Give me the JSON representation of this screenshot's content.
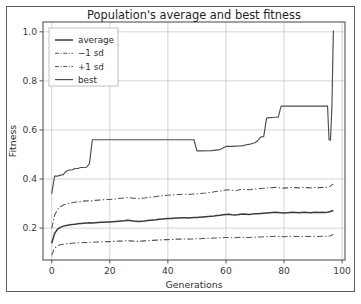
{
  "figure": {
    "background_color": "#ffffff",
    "border_color": "#5d5d5d",
    "width": 361,
    "height": 304
  },
  "chart_data": {
    "type": "line",
    "title": "Population's average and best fitness",
    "xlabel": "Generations",
    "ylabel": "Fitness",
    "xlim": [
      -3,
      101
    ],
    "ylim": [
      0.07,
      1.04
    ],
    "xticks": [
      0,
      20,
      40,
      60,
      80,
      100
    ],
    "xtick_labels": [
      "0",
      "20",
      "40",
      "60",
      "80",
      "100"
    ],
    "yticks": [
      0.2,
      0.4,
      0.6,
      0.8,
      1.0
    ],
    "ytick_labels": [
      "0.2",
      "0.4",
      "0.6",
      "0.8",
      "1.0"
    ],
    "grid": true,
    "grid_color": "#c9c9c9",
    "legend_position": "upper left",
    "line_color": "#4d4d4d",
    "series": [
      {
        "name": "average",
        "style": "solid",
        "color": "#3c3c3c",
        "x": [
          0,
          1,
          2,
          3,
          4,
          5,
          6,
          7,
          8,
          9,
          10,
          11,
          12,
          13,
          14,
          15,
          16,
          17,
          18,
          19,
          20,
          21,
          22,
          23,
          24,
          25,
          26,
          27,
          28,
          29,
          30,
          31,
          32,
          33,
          34,
          35,
          36,
          37,
          38,
          39,
          40,
          41,
          42,
          43,
          44,
          45,
          46,
          47,
          48,
          49,
          50,
          51,
          52,
          53,
          54,
          55,
          56,
          57,
          58,
          59,
          60,
          61,
          62,
          63,
          64,
          65,
          66,
          67,
          68,
          69,
          70,
          71,
          72,
          73,
          74,
          75,
          76,
          77,
          78,
          79,
          80,
          81,
          82,
          83,
          84,
          85,
          86,
          87,
          88,
          89,
          90,
          91,
          92,
          93,
          94,
          95,
          96,
          97
        ],
        "values": [
          0.138,
          0.178,
          0.196,
          0.203,
          0.208,
          0.211,
          0.213,
          0.215,
          0.216,
          0.218,
          0.219,
          0.22,
          0.221,
          0.222,
          0.221,
          0.222,
          0.223,
          0.224,
          0.224,
          0.225,
          0.225,
          0.226,
          0.227,
          0.228,
          0.229,
          0.23,
          0.232,
          0.231,
          0.229,
          0.228,
          0.227,
          0.228,
          0.229,
          0.231,
          0.232,
          0.233,
          0.234,
          0.236,
          0.237,
          0.238,
          0.239,
          0.239,
          0.24,
          0.241,
          0.241,
          0.242,
          0.242,
          0.241,
          0.242,
          0.243,
          0.243,
          0.244,
          0.245,
          0.246,
          0.247,
          0.248,
          0.249,
          0.251,
          0.252,
          0.254,
          0.255,
          0.256,
          0.254,
          0.253,
          0.254,
          0.256,
          0.257,
          0.256,
          0.255,
          0.257,
          0.258,
          0.259,
          0.26,
          0.261,
          0.262,
          0.263,
          0.264,
          0.265,
          0.264,
          0.263,
          0.262,
          0.263,
          0.264,
          0.265,
          0.264,
          0.263,
          0.264,
          0.265,
          0.264,
          0.263,
          0.264,
          0.265,
          0.264,
          0.265,
          0.264,
          0.265,
          0.268,
          0.272
        ]
      },
      {
        "name": "-1 sd",
        "style": "dashdot",
        "color": "#555555",
        "x": [
          0,
          1,
          2,
          3,
          4,
          5,
          6,
          7,
          8,
          9,
          10,
          11,
          12,
          13,
          14,
          15,
          16,
          17,
          18,
          19,
          20,
          21,
          22,
          23,
          24,
          25,
          26,
          27,
          28,
          29,
          30,
          31,
          32,
          33,
          34,
          35,
          36,
          37,
          38,
          39,
          40,
          41,
          42,
          43,
          44,
          45,
          46,
          47,
          48,
          49,
          50,
          51,
          52,
          53,
          54,
          55,
          56,
          57,
          58,
          59,
          60,
          61,
          62,
          63,
          64,
          65,
          66,
          67,
          68,
          69,
          70,
          71,
          72,
          73,
          74,
          75,
          76,
          77,
          78,
          79,
          80,
          81,
          82,
          83,
          84,
          85,
          86,
          87,
          88,
          89,
          90,
          91,
          92,
          93,
          94,
          95,
          96,
          97
        ],
        "values": [
          0.09,
          0.118,
          0.128,
          0.132,
          0.134,
          0.136,
          0.137,
          0.138,
          0.139,
          0.14,
          0.14,
          0.141,
          0.141,
          0.142,
          0.142,
          0.143,
          0.143,
          0.144,
          0.144,
          0.145,
          0.145,
          0.146,
          0.146,
          0.147,
          0.147,
          0.148,
          0.149,
          0.148,
          0.147,
          0.146,
          0.146,
          0.147,
          0.148,
          0.149,
          0.15,
          0.15,
          0.151,
          0.152,
          0.152,
          0.153,
          0.153,
          0.154,
          0.154,
          0.155,
          0.155,
          0.155,
          0.156,
          0.155,
          0.156,
          0.156,
          0.157,
          0.157,
          0.158,
          0.158,
          0.159,
          0.159,
          0.16,
          0.16,
          0.161,
          0.161,
          0.162,
          0.162,
          0.161,
          0.161,
          0.162,
          0.163,
          0.163,
          0.162,
          0.162,
          0.163,
          0.163,
          0.164,
          0.164,
          0.165,
          0.165,
          0.166,
          0.166,
          0.167,
          0.166,
          0.166,
          0.165,
          0.166,
          0.166,
          0.167,
          0.166,
          0.166,
          0.166,
          0.167,
          0.166,
          0.166,
          0.166,
          0.167,
          0.166,
          0.167,
          0.166,
          0.167,
          0.169,
          0.174
        ]
      },
      {
        "name": "+1 sd",
        "style": "dashdot",
        "color": "#555555",
        "x": [
          0,
          1,
          2,
          3,
          4,
          5,
          6,
          7,
          8,
          9,
          10,
          11,
          12,
          13,
          14,
          15,
          16,
          17,
          18,
          19,
          20,
          21,
          22,
          23,
          24,
          25,
          26,
          27,
          28,
          29,
          30,
          31,
          32,
          33,
          34,
          35,
          36,
          37,
          38,
          39,
          40,
          41,
          42,
          43,
          44,
          45,
          46,
          47,
          48,
          49,
          50,
          51,
          52,
          53,
          54,
          55,
          56,
          57,
          58,
          59,
          60,
          61,
          62,
          63,
          64,
          65,
          66,
          67,
          68,
          69,
          70,
          71,
          72,
          73,
          74,
          75,
          76,
          77,
          78,
          79,
          80,
          81,
          82,
          83,
          84,
          85,
          86,
          87,
          88,
          89,
          90,
          91,
          92,
          93,
          94,
          95,
          96,
          97
        ],
        "values": [
          0.199,
          0.252,
          0.276,
          0.287,
          0.294,
          0.298,
          0.301,
          0.303,
          0.305,
          0.307,
          0.308,
          0.31,
          0.311,
          0.312,
          0.311,
          0.313,
          0.314,
          0.315,
          0.316,
          0.317,
          0.317,
          0.318,
          0.319,
          0.321,
          0.322,
          0.323,
          0.325,
          0.324,
          0.322,
          0.321,
          0.32,
          0.322,
          0.323,
          0.325,
          0.326,
          0.327,
          0.329,
          0.331,
          0.332,
          0.333,
          0.334,
          0.335,
          0.336,
          0.337,
          0.337,
          0.338,
          0.338,
          0.337,
          0.338,
          0.339,
          0.34,
          0.341,
          0.342,
          0.343,
          0.345,
          0.346,
          0.348,
          0.35,
          0.351,
          0.353,
          0.355,
          0.356,
          0.354,
          0.353,
          0.354,
          0.357,
          0.358,
          0.357,
          0.356,
          0.358,
          0.359,
          0.36,
          0.361,
          0.362,
          0.363,
          0.364,
          0.365,
          0.366,
          0.365,
          0.364,
          0.363,
          0.364,
          0.365,
          0.366,
          0.365,
          0.364,
          0.365,
          0.366,
          0.365,
          0.364,
          0.365,
          0.366,
          0.365,
          0.366,
          0.365,
          0.367,
          0.371,
          0.38
        ]
      },
      {
        "name": "best",
        "style": "solid",
        "color": "#4d4d4d",
        "x": [
          0,
          1,
          2,
          3,
          4,
          5,
          6,
          7,
          8,
          9,
          10,
          11,
          12,
          13,
          14,
          15,
          20,
          25,
          30,
          35,
          40,
          45,
          49,
          50,
          51,
          55,
          58,
          60,
          62,
          65,
          66,
          67,
          68,
          69,
          70,
          71,
          72,
          73,
          74,
          75,
          76,
          77,
          78,
          79,
          80,
          85,
          90,
          93,
          94,
          95,
          95.5,
          96,
          96.5,
          97
        ],
        "values": [
          0.34,
          0.412,
          0.412,
          0.416,
          0.418,
          0.432,
          0.437,
          0.437,
          0.443,
          0.443,
          0.447,
          0.447,
          0.448,
          0.463,
          0.56,
          0.56,
          0.56,
          0.56,
          0.56,
          0.56,
          0.56,
          0.56,
          0.56,
          0.515,
          0.515,
          0.516,
          0.52,
          0.533,
          0.533,
          0.535,
          0.536,
          0.54,
          0.541,
          0.545,
          0.548,
          0.557,
          0.572,
          0.573,
          0.648,
          0.65,
          0.651,
          0.652,
          0.652,
          0.697,
          0.697,
          0.697,
          0.697,
          0.697,
          0.697,
          0.697,
          0.56,
          0.558,
          0.7,
          1.005
        ]
      }
    ]
  }
}
